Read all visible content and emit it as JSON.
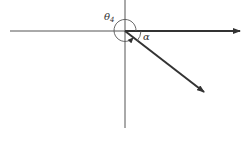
{
  "diagram": {
    "labels": {
      "theta": "θ",
      "theta_sub": "4",
      "alpha": "α"
    },
    "colors": {
      "line": "#333333",
      "background": "#ffffff"
    },
    "geometry": {
      "origin": [
        125,
        31
      ],
      "horizontal_axis": [
        [
          10,
          31
        ],
        [
          125,
          31
        ]
      ],
      "vertical_axis": [
        [
          125,
          0
        ],
        [
          125,
          128
        ]
      ],
      "vector_right": [
        [
          125,
          31
        ],
        [
          240,
          31
        ]
      ],
      "vector_diagonal": [
        [
          125,
          31
        ],
        [
          204,
          92
        ]
      ],
      "circle_radius": 11
    }
  }
}
